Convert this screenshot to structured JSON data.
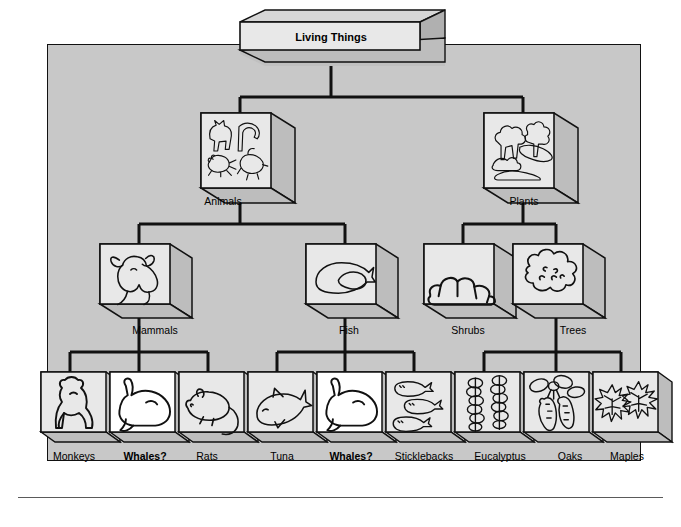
{
  "diagram": {
    "type": "hierarchy-tree",
    "title": "Living Things",
    "root": {
      "label": "Living Things",
      "icon": "none",
      "highlight": false
    },
    "level2": [
      {
        "label": "Animals",
        "icon": "animals-group-icon",
        "highlight": false
      },
      {
        "label": "Plants",
        "icon": "plants-group-icon",
        "highlight": false
      }
    ],
    "level3": [
      {
        "label": "Mammals",
        "icon": "cow-head-icon",
        "parent": "Animals",
        "highlight": false
      },
      {
        "label": "Fish",
        "icon": "fish-body-icon",
        "parent": "Animals",
        "highlight": false
      },
      {
        "label": "Shrubs",
        "icon": "shrub-icon",
        "parent": "Plants",
        "highlight": false
      },
      {
        "label": "Trees",
        "icon": "tree-icon",
        "parent": "Plants",
        "highlight": false
      }
    ],
    "leaves": [
      {
        "label": "Monkeys",
        "icon": "monkey-icon",
        "parent": "Mammals",
        "highlight": false,
        "bold": false
      },
      {
        "label": "Whales?",
        "icon": "whale-icon",
        "parent": "Mammals",
        "highlight": true,
        "bold": true
      },
      {
        "label": "Rats",
        "icon": "rat-icon",
        "parent": "Mammals",
        "highlight": false,
        "bold": false
      },
      {
        "label": "Tuna",
        "icon": "tuna-icon",
        "parent": "Fish",
        "highlight": false,
        "bold": false
      },
      {
        "label": "Whales?",
        "icon": "whale-icon",
        "parent": "Fish",
        "highlight": true,
        "bold": true
      },
      {
        "label": "Sticklebacks",
        "icon": "sticklebacks-icon",
        "parent": "Fish",
        "highlight": false,
        "bold": false
      },
      {
        "label": "Eucalyptus",
        "icon": "eucalyptus-leaves-icon",
        "parent": "Trees",
        "highlight": false,
        "bold": false
      },
      {
        "label": "Oaks",
        "icon": "acorn-icon",
        "parent": "Trees",
        "highlight": false,
        "bold": false
      },
      {
        "label": "Maples",
        "icon": "maple-leaf-icon",
        "parent": "Trees",
        "highlight": false,
        "bold": false
      }
    ],
    "colors": {
      "panel_background": "#c8c8c8",
      "box_face": "#e8e8e8",
      "box_face_highlight": "#ffffff",
      "box_side": "#b4b4b4",
      "line": "#000000",
      "page_background": "#ffffff"
    }
  }
}
